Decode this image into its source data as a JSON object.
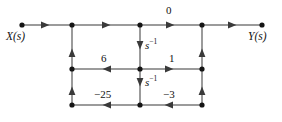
{
  "figure": {
    "type": "signal-flow-graph",
    "background": "#ffffff",
    "stroke_color": "#6b6b6b",
    "node_color": "#1a1a1a",
    "text_color": "#111111",
    "width": 282,
    "height": 122
  },
  "terminals": {
    "input_label": "X(s)",
    "output_label": "Y(s)"
  },
  "nodes": [
    {
      "id": "n_in",
      "name": "input-node",
      "x": 22,
      "y": 25
    },
    {
      "id": "n_t1",
      "name": "top-node-1",
      "x": 72,
      "y": 25
    },
    {
      "id": "n_t2",
      "name": "top-node-2",
      "x": 140,
      "y": 25
    },
    {
      "id": "n_t3",
      "name": "top-node-3",
      "x": 202,
      "y": 25
    },
    {
      "id": "n_out",
      "name": "output-node",
      "x": 262,
      "y": 25
    },
    {
      "id": "n_m1",
      "name": "middle-node-left",
      "x": 72,
      "y": 69
    },
    {
      "id": "n_m2",
      "name": "middle-node-mid",
      "x": 140,
      "y": 69
    },
    {
      "id": "n_m3",
      "name": "middle-node-right",
      "x": 202,
      "y": 69
    },
    {
      "id": "n_b1",
      "name": "bottom-node-left",
      "x": 72,
      "y": 105
    },
    {
      "id": "n_b2",
      "name": "bottom-node-mid",
      "x": 140,
      "y": 105
    },
    {
      "id": "n_b3",
      "name": "bottom-node-right",
      "x": 202,
      "y": 105
    }
  ],
  "edges": [
    {
      "name": "edge-input-to-top1",
      "from": "n_in",
      "to": "n_t1",
      "direction": "right",
      "gain": ""
    },
    {
      "name": "edge-top1-to-top2",
      "from": "n_t1",
      "to": "n_t2",
      "direction": "right",
      "gain": ""
    },
    {
      "name": "edge-top2-to-top3",
      "from": "n_t2",
      "to": "n_t3",
      "direction": "right",
      "gain": "0"
    },
    {
      "name": "edge-top3-to-output",
      "from": "n_t3",
      "to": "n_out",
      "direction": "right",
      "gain": ""
    },
    {
      "name": "edge-top2-to-middle-mid",
      "from": "n_t2",
      "to": "n_m2",
      "direction": "down",
      "gain": "s^-1"
    },
    {
      "name": "edge-middle-mid-to-bottom",
      "from": "n_m2",
      "to": "n_b2",
      "direction": "down",
      "gain": "s^-1"
    },
    {
      "name": "edge-middle-left-to-top1",
      "from": "n_m1",
      "to": "n_t1",
      "direction": "up",
      "gain": ""
    },
    {
      "name": "edge-bottom-left-to-middle",
      "from": "n_b1",
      "to": "n_m1",
      "direction": "up",
      "gain": ""
    },
    {
      "name": "edge-middle-right-to-top3",
      "from": "n_m3",
      "to": "n_t3",
      "direction": "up",
      "gain": ""
    },
    {
      "name": "edge-bottom-right-to-middle",
      "from": "n_b3",
      "to": "n_m3",
      "direction": "up",
      "gain": ""
    },
    {
      "name": "edge-middle-mid-to-left",
      "from": "n_m2",
      "to": "n_m1",
      "direction": "left",
      "gain": "6"
    },
    {
      "name": "edge-middle-mid-to-right",
      "from": "n_m2",
      "to": "n_m3",
      "direction": "right",
      "gain": "1"
    },
    {
      "name": "edge-bottom-mid-to-left",
      "from": "n_b2",
      "to": "n_b1",
      "direction": "left",
      "gain": "-25"
    },
    {
      "name": "edge-bottom-right-to-mid",
      "from": "n_b3",
      "to": "n_b2",
      "direction": "left",
      "gain": "-3"
    }
  ],
  "gain_labels": {
    "top_zero": "0",
    "integrator_upper_base": "s",
    "integrator_upper_exp": "−1",
    "integrator_lower_base": "s",
    "integrator_lower_exp": "−1",
    "middle_left": "6",
    "middle_right": "1",
    "bottom_left": "−25",
    "bottom_right": "−3"
  }
}
